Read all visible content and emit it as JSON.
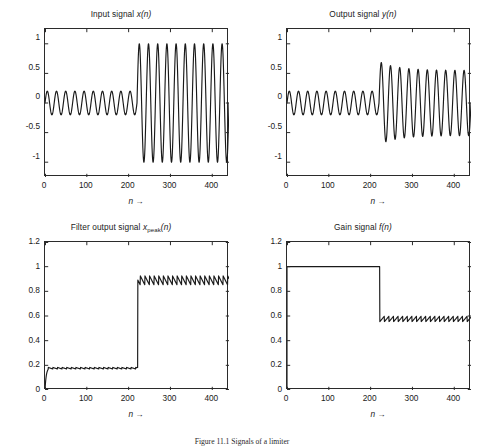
{
  "figure": {
    "caption": "Figure 11.1 Signals of a limiter"
  },
  "axis_label": "n →",
  "panels": [
    {
      "id": "input-signal",
      "title_prefix": "Input signal ",
      "title_var": "x",
      "title_sub": "",
      "title_suffix": "(n)",
      "xlabel": "n →",
      "yticks": [
        "-1",
        "-0.5",
        "0",
        "0.5",
        "1"
      ],
      "xticks": [
        "0",
        "100",
        "200",
        "300",
        "400"
      ]
    },
    {
      "id": "output-signal",
      "title_prefix": "Output signal ",
      "title_var": "y",
      "title_sub": "",
      "title_suffix": "(n)",
      "xlabel": "n →",
      "yticks": [
        "-1",
        "-0.5",
        "0",
        "0.5",
        "1"
      ],
      "xticks": [
        "0",
        "100",
        "200",
        "300",
        "400"
      ]
    },
    {
      "id": "filter-output-signal",
      "title_prefix": "Filter output signal ",
      "title_var": "x",
      "title_sub": "peak",
      "title_suffix": "(n)",
      "xlabel": "n →",
      "yticks": [
        "0",
        "0.2",
        "0.4",
        "0.6",
        "0.8",
        "1",
        "1.2"
      ],
      "xticks": [
        "0",
        "100",
        "200",
        "300",
        "400"
      ]
    },
    {
      "id": "gain-signal",
      "title_prefix": "Gain signal ",
      "title_var": "f",
      "title_sub": "",
      "title_suffix": "(n)",
      "xlabel": "n →",
      "yticks": [
        "0",
        "0.2",
        "0.4",
        "0.6",
        "0.8",
        "1",
        "1.2"
      ],
      "xticks": [
        "0",
        "100",
        "200",
        "300",
        "400"
      ]
    }
  ],
  "chart_data": [
    {
      "type": "line",
      "id": "input-signal",
      "title": "Input signal x(n)",
      "xlabel": "n →",
      "ylabel": "",
      "xlim": [
        0,
        440
      ],
      "ylim": [
        -1.25,
        1.25
      ],
      "xticks": [
        0,
        100,
        200,
        300,
        400
      ],
      "yticks": [
        -1,
        -0.5,
        0,
        0.5,
        1
      ],
      "grid": false,
      "legend": null,
      "description": "Sinusoid x(n) with amplitude 0.2 for n<220 then amplitude 1.0 for n>=220; period about 22 samples.",
      "model": {
        "kind": "sine_amplitude_step",
        "period": 22.0,
        "phase": 0.0,
        "amp_before": 0.2,
        "amp_after": 1.0,
        "step_n": 220,
        "n_start": 0,
        "n_end": 440
      }
    },
    {
      "type": "line",
      "id": "output-signal",
      "title": "Output signal y(n)",
      "xlabel": "n →",
      "ylabel": "",
      "xlim": [
        0,
        440
      ],
      "ylim": [
        -1.25,
        1.25
      ],
      "xticks": [
        0,
        100,
        200,
        300,
        400
      ],
      "yticks": [
        -1,
        -0.5,
        0,
        0.5,
        1
      ],
      "grid": false,
      "legend": null,
      "description": "Limiter output: amplitude 0.2 before n=220, transient overshoot peak 0.70 at n≈222, settles to about 0.55.",
      "model": {
        "kind": "sine_limited",
        "period": 22.0,
        "phase": 0.0,
        "amp_before": 0.2,
        "amp_overshoot": 0.7,
        "amp_settled": 0.55,
        "step_n": 220,
        "decay_tau": 45,
        "n_start": 0,
        "n_end": 440
      }
    },
    {
      "type": "line",
      "id": "filter-output-signal",
      "title": "Filter output signal x_peak(n)",
      "xlabel": "n →",
      "ylabel": "",
      "xlim": [
        0,
        440
      ],
      "ylim": [
        0,
        1.2
      ],
      "xticks": [
        0,
        100,
        200,
        300,
        400
      ],
      "yticks": [
        0,
        0.2,
        0.4,
        0.6,
        0.8,
        1,
        1.2
      ],
      "grid": false,
      "legend": null,
      "description": "Peak detector output: rises from 0 to about 0.18 within first 10 samples, small sawtooth ripple 0.17-0.19 until n=220, then jumps to about 0.92 with sawtooth ripple between 0.85 and 0.93.",
      "model": {
        "kind": "peak_detector",
        "period": 22.0,
        "attack_n": 8,
        "level_before": 0.183,
        "ripple_before": 0.013,
        "level_after": 0.925,
        "ripple_after": 0.075,
        "step_n": 220,
        "n_start": 0,
        "n_end": 440
      }
    },
    {
      "type": "line",
      "id": "gain-signal",
      "title": "Gain signal f(n)",
      "xlabel": "n →",
      "ylabel": "",
      "xlim": [
        0,
        440
      ],
      "ylim": [
        0,
        1.2
      ],
      "xticks": [
        0,
        100,
        200,
        300,
        400
      ],
      "yticks": [
        0,
        0.2,
        0.4,
        0.6,
        0.8,
        1,
        1.2
      ],
      "grid": false,
      "legend": null,
      "description": "Gain stays at 1.0 until n=220, then drops to about 0.55 with sawtooth ripple between 0.53 and 0.60.",
      "model": {
        "kind": "gain",
        "period": 22.0,
        "level_before": 1.0,
        "level_after": 0.555,
        "ripple_after": 0.045,
        "step_n": 222,
        "n_start": 0,
        "n_end": 440
      }
    }
  ],
  "colors": {
    "line": "#1a1a1a",
    "axis": "#2b2b2b",
    "background": "#ffffff",
    "text": "#1a1a1a"
  }
}
